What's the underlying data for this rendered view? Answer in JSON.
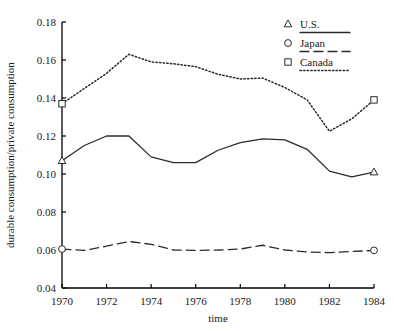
{
  "chart_data": {
    "type": "line",
    "title": "",
    "xlabel": "time",
    "ylabel": "durable consumption/private consumption",
    "x": [
      1970,
      1971,
      1972,
      1973,
      1974,
      1975,
      1976,
      1977,
      1978,
      1979,
      1980,
      1981,
      1982,
      1983,
      1984
    ],
    "xlim": [
      1970,
      1984
    ],
    "ylim": [
      0.04,
      0.18
    ],
    "xticks": [
      1970,
      1972,
      1974,
      1976,
      1978,
      1980,
      1982,
      1984
    ],
    "xtick_labels": [
      "1970",
      "1972",
      "1974",
      "1976",
      "1978",
      "1980",
      "1982",
      "1984"
    ],
    "yticks": [
      0.04,
      0.06,
      0.08,
      0.1,
      0.12,
      0.14,
      0.16,
      0.18
    ],
    "ytick_labels": [
      "0.04",
      "0.06",
      "0.08",
      "0.10",
      "0.12",
      "0.14",
      "0.16",
      "0.18"
    ],
    "grid": false,
    "legend_position": "top-right",
    "series": [
      {
        "name": "U.S.",
        "marker": "triangle",
        "linestyle": "solid",
        "color": "#2b2b2b",
        "values": [
          0.107,
          0.115,
          0.12,
          0.12,
          0.109,
          0.106,
          0.106,
          0.1125,
          0.1165,
          0.1185,
          0.118,
          0.113,
          0.1015,
          0.0985,
          0.101
        ]
      },
      {
        "name": "Japan",
        "marker": "circle",
        "linestyle": "dashed",
        "color": "#2b2b2b",
        "values": [
          0.0605,
          0.0598,
          0.062,
          0.0645,
          0.063,
          0.06,
          0.0598,
          0.06,
          0.0605,
          0.0625,
          0.06,
          0.059,
          0.0586,
          0.0592,
          0.0598
        ]
      },
      {
        "name": "Canada",
        "marker": "square",
        "linestyle": "dotted",
        "color": "#2b2b2b",
        "values": [
          0.137,
          0.145,
          0.153,
          0.163,
          0.159,
          0.158,
          0.1565,
          0.1525,
          0.15,
          0.1505,
          0.1455,
          0.139,
          0.1225,
          0.129,
          0.139
        ]
      }
    ]
  },
  "legend": {
    "items": [
      {
        "label": "U.S.",
        "marker": "triangle",
        "linestyle": "solid"
      },
      {
        "label": "Japan",
        "marker": "circle",
        "linestyle": "dashed"
      },
      {
        "label": "Canada",
        "marker": "square",
        "linestyle": "dotted"
      }
    ]
  }
}
